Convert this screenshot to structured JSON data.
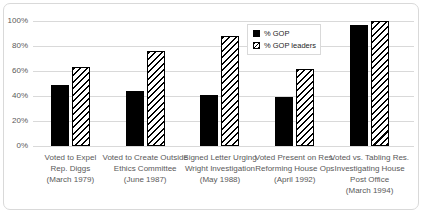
{
  "chart_data": {
    "type": "bar",
    "title": "",
    "xlabel": "",
    "ylabel": "",
    "ylim": [
      0,
      100
    ],
    "yticks": [
      0,
      20,
      40,
      60,
      80,
      100
    ],
    "ytick_labels": [
      "0%",
      "20%",
      "40%",
      "60%",
      "80%",
      "100%"
    ],
    "grid": "horizontal",
    "legend_position": "inside-top-center-right",
    "categories": [
      {
        "label": "Voted to Expel Rep. Diggs (March 1979)",
        "lines": [
          "Voted to Expel",
          "Rep. Diggs",
          "(March 1979)"
        ]
      },
      {
        "label": "Voted to Create Outside Ethics Committee (June 1987)",
        "lines": [
          "Voted to Create Outside",
          "Ethics Committee",
          "(June 1987)"
        ]
      },
      {
        "label": "Signed Letter Urging Wright Investigation (May 1988)",
        "lines": [
          "Signed Letter Urging",
          "Wright Investigation",
          "(May 1988)"
        ]
      },
      {
        "label": "Voted Present on Res. Reforming House Ops (April 1992)",
        "lines": [
          "Voted Present on Res.",
          "Reforming House Ops",
          "(April 1992)"
        ]
      },
      {
        "label": "Voted vs. Tabling Res. Investigating House Post Office (March 1994)",
        "lines": [
          "Voted vs. Tabling Res.",
          "Investigating House",
          "Post Office",
          "(March 1994)"
        ]
      }
    ],
    "series": [
      {
        "name": "% GOP",
        "fill": "solid-black",
        "values": [
          49,
          44,
          41,
          39,
          97
        ]
      },
      {
        "name": "% GOP leaders",
        "fill": "diagonal-hatch",
        "values": [
          63,
          76,
          88,
          62,
          100
        ]
      }
    ],
    "colors": {
      "bar": "#000000",
      "gridline": "#d9d9d9",
      "axis_text": "#595959",
      "frame_border": "#d9d9d9",
      "background": "#ffffff"
    }
  }
}
